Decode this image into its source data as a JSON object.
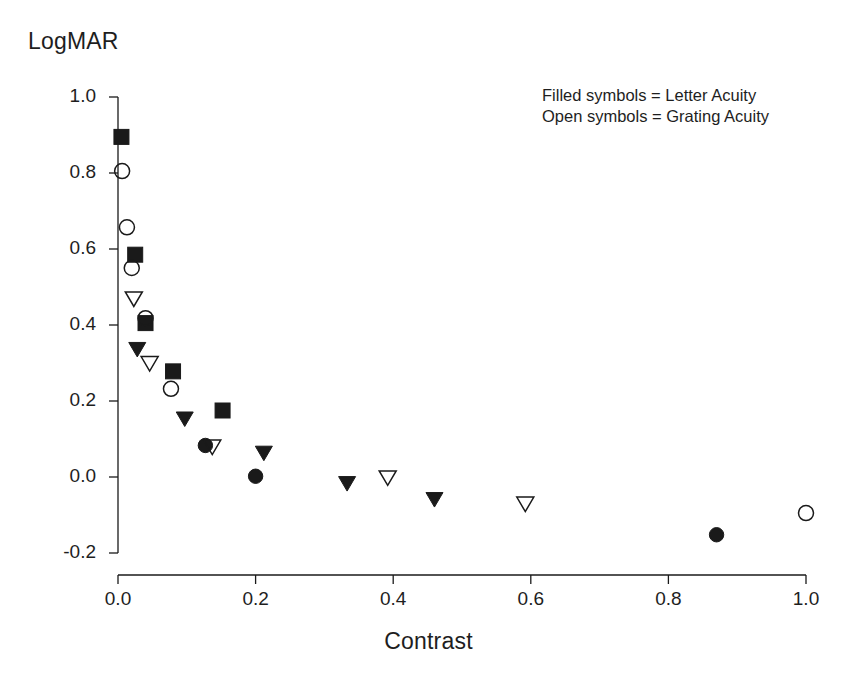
{
  "chart_data": {
    "type": "scatter",
    "title": "",
    "xlabel": "Contrast",
    "ylabel": "LogMAR",
    "xlim": [
      0.0,
      1.0
    ],
    "ylim": [
      -0.2,
      1.0
    ],
    "xticks": [
      "0.0",
      "0.2",
      "0.4",
      "0.6",
      "0.8",
      "1.0"
    ],
    "xtick_values": [
      0.0,
      0.2,
      0.4,
      0.6,
      0.8,
      1.0
    ],
    "yticks": [
      "1.0",
      "0.8",
      "0.6",
      "0.4",
      "0.2",
      "0.0",
      "-0.2"
    ],
    "ytick_values": [
      1.0,
      0.8,
      0.6,
      0.4,
      0.2,
      0.0,
      -0.2
    ],
    "grid": false,
    "legend_position": "top-right",
    "legend": [
      "Filled symbols = Letter Acuity",
      "Open symbols = Grating Acuity"
    ],
    "series": [
      {
        "name": "Letter Acuity (filled square)",
        "marker": "filled-square",
        "filled": true,
        "points": [
          {
            "x": 0.005,
            "y": 0.895
          },
          {
            "x": 0.025,
            "y": 0.585
          },
          {
            "x": 0.04,
            "y": 0.405
          },
          {
            "x": 0.08,
            "y": 0.278
          },
          {
            "x": 0.152,
            "y": 0.175
          }
        ]
      },
      {
        "name": "Letter Acuity (filled circle)",
        "marker": "filled-circle",
        "filled": true,
        "points": [
          {
            "x": 0.127,
            "y": 0.083
          },
          {
            "x": 0.2,
            "y": 0.002
          },
          {
            "x": 0.87,
            "y": -0.152
          }
        ]
      },
      {
        "name": "Letter Acuity (filled triangle)",
        "marker": "filled-triangle-down",
        "filled": true,
        "points": [
          {
            "x": 0.028,
            "y": 0.335
          },
          {
            "x": 0.097,
            "y": 0.152
          },
          {
            "x": 0.212,
            "y": 0.062
          },
          {
            "x": 0.333,
            "y": -0.018
          },
          {
            "x": 0.46,
            "y": -0.06
          }
        ]
      },
      {
        "name": "Grating Acuity (open circle)",
        "marker": "open-circle",
        "filled": false,
        "points": [
          {
            "x": 0.006,
            "y": 0.805
          },
          {
            "x": 0.013,
            "y": 0.657
          },
          {
            "x": 0.02,
            "y": 0.55
          },
          {
            "x": 0.04,
            "y": 0.418
          },
          {
            "x": 0.077,
            "y": 0.232
          },
          {
            "x": 1.0,
            "y": -0.095
          }
        ]
      },
      {
        "name": "Grating Acuity (open triangle)",
        "marker": "open-triangle-down",
        "filled": false,
        "points": [
          {
            "x": 0.023,
            "y": 0.468
          },
          {
            "x": 0.046,
            "y": 0.298
          },
          {
            "x": 0.137,
            "y": 0.078
          },
          {
            "x": 0.392,
            "y": -0.003
          },
          {
            "x": 0.592,
            "y": -0.072
          }
        ]
      }
    ]
  },
  "axes": {
    "y_title": "LogMAR",
    "x_title": "Contrast"
  }
}
